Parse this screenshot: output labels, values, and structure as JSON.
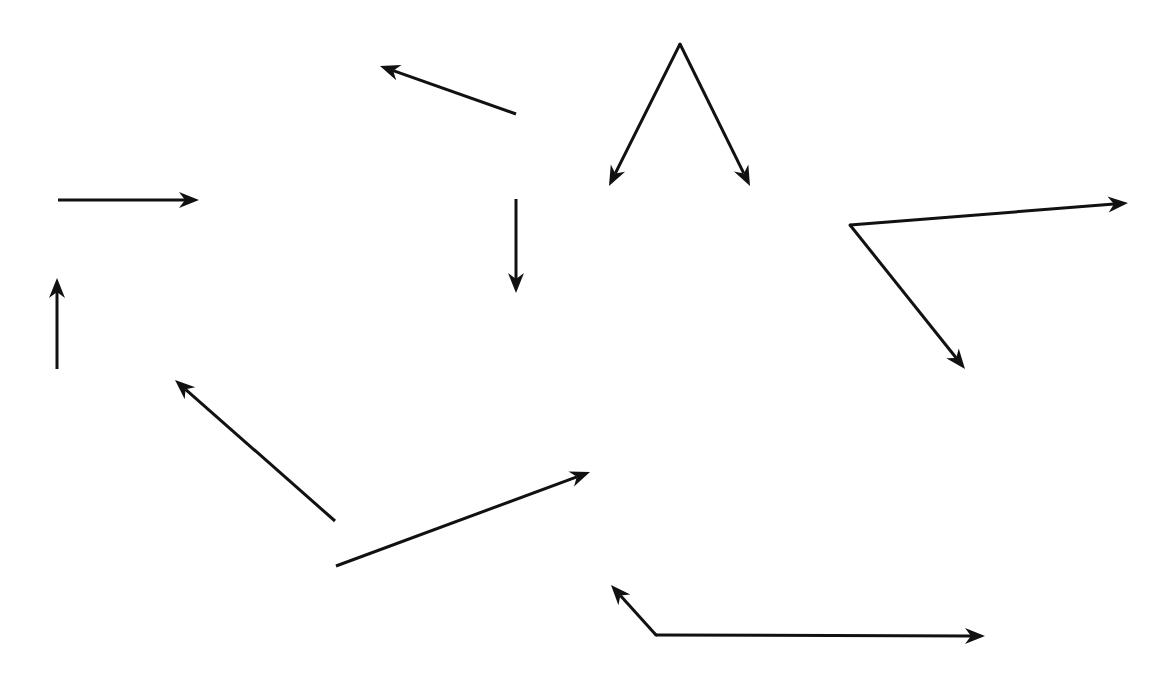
{
  "canvas": {
    "width": 1173,
    "height": 684,
    "background": "#ffffff"
  },
  "style": {
    "stroke": "#111111",
    "stroke_width": 3,
    "head_length": 20,
    "head_width": 16
  },
  "arrows": [
    {
      "id": "arrow-horizontal-right",
      "from": [
        58,
        200
      ],
      "to": [
        199,
        200
      ]
    },
    {
      "id": "arrow-vertical-up",
      "from": [
        57,
        369
      ],
      "to": [
        57,
        278
      ]
    },
    {
      "id": "arrow-up-left",
      "from": [
        516,
        114
      ],
      "to": [
        380,
        66
      ]
    },
    {
      "id": "arrow-vertical-down",
      "from": [
        516,
        199
      ],
      "to": [
        516,
        293
      ]
    },
    {
      "id": "arrow-diagonal-up-left",
      "from": [
        335,
        521
      ],
      "to": [
        175,
        380
      ]
    },
    {
      "id": "arrow-diagonal-up-right",
      "from": [
        336,
        566
      ],
      "to": [
        590,
        472
      ]
    }
  ],
  "angles": [
    {
      "id": "angle-top-peak",
      "vertex": [
        680,
        44
      ],
      "rays": [
        [
          609,
          186
        ],
        [
          750,
          186
        ]
      ]
    },
    {
      "id": "angle-right",
      "vertex": [
        850,
        225
      ],
      "rays": [
        [
          1128,
          203
        ],
        [
          965,
          369
        ]
      ]
    },
    {
      "id": "angle-bottom",
      "vertex": [
        656,
        635
      ],
      "rays": [
        [
          611,
          585
        ],
        [
          985,
          636
        ]
      ]
    }
  ]
}
